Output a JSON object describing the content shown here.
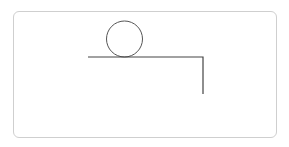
{
  "diagram": {
    "frame": {
      "x": 13,
      "y": 11,
      "width": 264,
      "height": 127,
      "radius": 6,
      "stroke": "#cfcfcf"
    },
    "ball": {
      "cx": 124.5,
      "cy": 39,
      "r": 18,
      "stroke": "#555555"
    },
    "ledge": {
      "points": [
        [
          88,
          57
        ],
        [
          203,
          57
        ],
        [
          203,
          94
        ]
      ],
      "stroke": "#444444"
    },
    "labels": []
  }
}
